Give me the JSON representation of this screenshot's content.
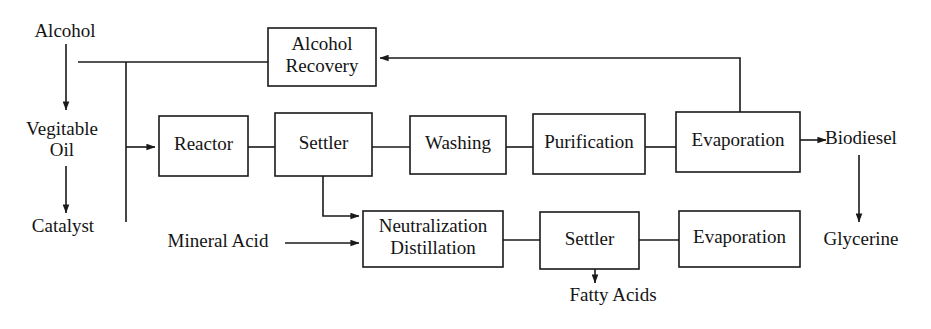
{
  "diagram": {
    "type": "process-flow",
    "canvas": {
      "width": 931,
      "height": 329
    },
    "colors": {
      "background": "#ffffff",
      "line": "#1a1a1a",
      "text": "#141414",
      "box_fill": "#ffffff"
    },
    "process_boxes": [
      {
        "id": "alcohol-recovery",
        "lines": [
          "Alcohol",
          "Recovery"
        ],
        "x": 268,
        "y": 28,
        "w": 108,
        "h": 58
      },
      {
        "id": "reactor",
        "lines": [
          "Reactor"
        ],
        "x": 159,
        "y": 116,
        "w": 89,
        "h": 60
      },
      {
        "id": "settler-main",
        "lines": [
          "Settler"
        ],
        "x": 275,
        "y": 113,
        "w": 97,
        "h": 63
      },
      {
        "id": "washing",
        "lines": [
          "Washing"
        ],
        "x": 410,
        "y": 116,
        "w": 96,
        "h": 58
      },
      {
        "id": "purification",
        "lines": [
          "Purification"
        ],
        "x": 533,
        "y": 114,
        "w": 112,
        "h": 60
      },
      {
        "id": "evaporation-top",
        "lines": [
          "Evaporation"
        ],
        "x": 676,
        "y": 112,
        "w": 124,
        "h": 60
      },
      {
        "id": "neutralization-distillation",
        "lines": [
          "Neutralization",
          "Distillation"
        ],
        "x": 363,
        "y": 211,
        "w": 140,
        "h": 56
      },
      {
        "id": "settler-bottom",
        "lines": [
          "Settler"
        ],
        "x": 540,
        "y": 212,
        "w": 99,
        "h": 57
      },
      {
        "id": "evaporation-bottom",
        "lines": [
          "Evaporation"
        ],
        "x": 679,
        "y": 211,
        "w": 121,
        "h": 56
      }
    ],
    "stream_labels": [
      {
        "id": "alcohol",
        "text": "Alcohol",
        "x": 65,
        "y": 33
      },
      {
        "id": "vegitable-oil",
        "text": "Vegitable",
        "x": 62,
        "y": 131
      },
      {
        "id": "vegitable-oil-2",
        "text": "Oil",
        "x": 62,
        "y": 152
      },
      {
        "id": "catalyst",
        "text": "Catalyst",
        "x": 63,
        "y": 228
      },
      {
        "id": "mineral-acid",
        "text": "Mineral Acid",
        "x": 218,
        "y": 243
      },
      {
        "id": "biodiesel",
        "text": "Biodiesel",
        "x": 861,
        "y": 140
      },
      {
        "id": "glycerine",
        "text": "Glycerine",
        "x": 861,
        "y": 241
      },
      {
        "id": "fatty-acids",
        "text": "Fatty Acids",
        "x": 613,
        "y": 297
      }
    ],
    "connections": [
      {
        "id": "alcohol-to-feed",
        "from": "Alcohol",
        "to": "Vegitable Oil",
        "arrow": true,
        "path": "M 66,44 L 66,110"
      },
      {
        "id": "vegoil-to-catalyst",
        "from": "Vegitable Oil",
        "to": "Catalyst",
        "arrow": true,
        "path": "M 66,166 L 66,213"
      },
      {
        "id": "recovery-to-feedline",
        "from": "Alcohol Recovery",
        "to": "feed header",
        "arrow": false,
        "path": "M 268,62 L 78,62"
      },
      {
        "id": "feed-header-drop",
        "from": "feed header",
        "to": "catalyst riser",
        "arrow": false,
        "path": "M 126,62 L 126,222"
      },
      {
        "id": "feed-to-reactor",
        "from": "feed header",
        "to": "Reactor",
        "arrow": true,
        "path": "M 126,147 L 155,147"
      },
      {
        "id": "reactor-to-settler",
        "from": "Reactor",
        "to": "Settler",
        "arrow": false,
        "path": "M 248,147 L 275,147"
      },
      {
        "id": "settler-to-washing",
        "from": "Settler",
        "to": "Washing",
        "arrow": false,
        "path": "M 372,147 L 410,147"
      },
      {
        "id": "washing-to-purification",
        "from": "Washing",
        "to": "Purification",
        "arrow": false,
        "path": "M 506,147 L 533,147"
      },
      {
        "id": "purification-to-evaporation",
        "from": "Purification",
        "to": "Evaporation",
        "arrow": false,
        "path": "M 645,147 L 676,147"
      },
      {
        "id": "evaporation-to-biodiesel",
        "from": "Evaporation",
        "to": "Biodiesel",
        "arrow": true,
        "path": "M 800,140 L 826,140"
      },
      {
        "id": "evaporation-recycle",
        "from": "Evaporation",
        "to": "Alcohol Recovery",
        "arrow": true,
        "path": "M 740,112 L 740,58 L 380,58"
      },
      {
        "id": "settler-to-neutralization",
        "from": "Settler",
        "to": "Neutralization Distillation",
        "arrow": true,
        "path": "M 323,176 L 323,216 L 359,216"
      },
      {
        "id": "mineralacid-to-neutralization",
        "from": "Mineral Acid",
        "to": "Neutralization Distillation",
        "arrow": true,
        "path": "M 285,243 L 359,243"
      },
      {
        "id": "neutralization-to-settler",
        "from": "Neutralization Distillation",
        "to": "Settler",
        "arrow": false,
        "path": "M 503,240 L 540,240"
      },
      {
        "id": "settler-to-evaporation-bottom",
        "from": "Settler",
        "to": "Evaporation",
        "arrow": false,
        "path": "M 639,240 L 679,240"
      },
      {
        "id": "settler-to-fattyacids",
        "from": "Settler",
        "to": "Fatty Acids",
        "arrow": true,
        "path": "M 595,269 L 595,283"
      },
      {
        "id": "biodiesel-to-glycerine",
        "from": "Biodiesel",
        "to": "Glycerine",
        "arrow": true,
        "path": "M 859,155 L 859,222"
      }
    ]
  }
}
